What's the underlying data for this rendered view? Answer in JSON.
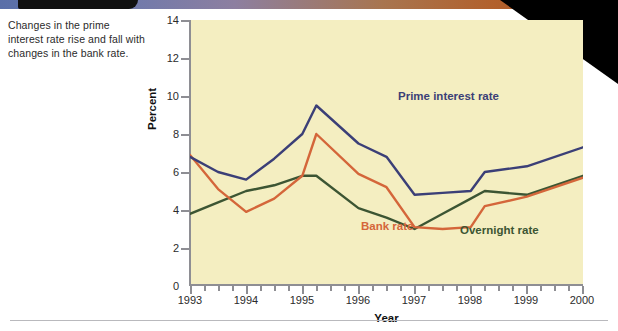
{
  "caption": "Changes in the prime interest rate rise and fall with changes in the bank rate.",
  "axis": {
    "y_title": "Percent",
    "x_title": "Year",
    "y_ticks": [
      "14",
      "12",
      "10",
      "8",
      "6",
      "4",
      "2",
      "0"
    ],
    "x_ticks": [
      "1993",
      "1994",
      "1995",
      "1996",
      "1997",
      "1998",
      "1999",
      "2000"
    ]
  },
  "series_labels": {
    "prime": "Prime interest rate",
    "bank": "Bank rate",
    "overnight": "Overnight rate"
  },
  "colors": {
    "prime": "#3b3f77",
    "bank": "#d4663a",
    "overnight": "#3c5533",
    "plot_background": "#f4eec1",
    "axis": "#8e8e93",
    "corner_wedge": "#000000"
  },
  "chart_data": {
    "type": "line",
    "title": "",
    "xlabel": "Year",
    "ylabel": "Percent",
    "xlim": [
      1993,
      2000
    ],
    "ylim": [
      0,
      14
    ],
    "grid": false,
    "legend_position": "inline-annotations",
    "x": [
      1993,
      1993.5,
      1994,
      1994.5,
      1995,
      1995.25,
      1996,
      1996.5,
      1997,
      1997.5,
      1998,
      1998.25,
      1999,
      2000
    ],
    "series": [
      {
        "name": "Prime interest rate",
        "color": "#3b3f77",
        "values": [
          6.8,
          6.0,
          5.6,
          6.7,
          8.0,
          9.5,
          7.5,
          6.8,
          4.8,
          4.9,
          5.0,
          6.0,
          6.3,
          7.3
        ]
      },
      {
        "name": "Bank rate",
        "color": "#d4663a",
        "values": [
          6.9,
          5.1,
          3.9,
          4.6,
          5.8,
          8.0,
          5.9,
          5.2,
          3.1,
          3.0,
          3.1,
          4.2,
          4.7,
          5.7
        ]
      },
      {
        "name": "Overnight rate",
        "color": "#3c5533",
        "values": [
          3.8,
          4.4,
          5.0,
          5.3,
          5.8,
          5.8,
          4.1,
          3.6,
          3.0,
          3.8,
          4.6,
          5.0,
          4.8,
          5.8
        ]
      }
    ]
  }
}
